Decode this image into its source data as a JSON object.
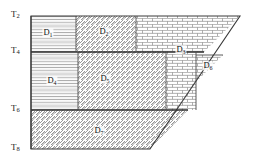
{
  "figure": {
    "type": "domain-decomposition-diagram",
    "shape": "trapezoid",
    "stroke_color": "#333333",
    "hatch_color": "#8a8a8a",
    "background": "#ffffff"
  },
  "axis": {
    "name": "time-axis",
    "ticks": [
      {
        "label": "T",
        "sub": "2",
        "y": 16
      },
      {
        "label": "T",
        "sub": "4",
        "y": 52
      },
      {
        "label": "T",
        "sub": "6",
        "y": 110
      },
      {
        "label": "T",
        "sub": "8",
        "y": 149
      }
    ]
  },
  "subdomains": [
    {
      "name": "D",
      "sub": "1",
      "pattern": "horizontal-lines",
      "cx": 48,
      "cy": 33
    },
    {
      "name": "D",
      "sub": "2",
      "pattern": "diagonal-hatch",
      "cx": 104,
      "cy": 32
    },
    {
      "name": "D",
      "sub": "3",
      "pattern": "brick",
      "cx": 181,
      "cy": 50
    },
    {
      "name": "D",
      "sub": "4",
      "pattern": "horizontal-lines",
      "cx": 52,
      "cy": 81
    },
    {
      "name": "D",
      "sub": "5",
      "pattern": "diagonal-hatch",
      "cx": 105,
      "cy": 79
    },
    {
      "name": "D",
      "sub": "6",
      "pattern": "brick",
      "cx": 208,
      "cy": 66
    },
    {
      "name": "D",
      "sub": "7",
      "pattern": "diagonal-hatch",
      "cx": 99,
      "cy": 131
    }
  ]
}
